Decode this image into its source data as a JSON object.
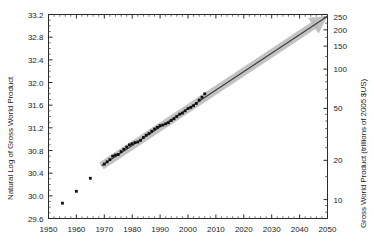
{
  "chart_data": {
    "type": "scatter",
    "title": "",
    "subtitle": "",
    "xlabel": "",
    "ylabel": "Natural Log of Gross World Product",
    "y2label": "Gross World Product (trillions of 2005 $US)",
    "xlim": [
      1950,
      2050
    ],
    "ylim": [
      29.6,
      33.2
    ],
    "grid": false,
    "legend": false,
    "legend_position": "none",
    "xticks": [
      1950,
      1960,
      1970,
      1980,
      1990,
      2000,
      2010,
      2020,
      2030,
      2040,
      2050
    ],
    "xtick_labels": [
      "1950",
      "1960",
      "1970",
      "1980",
      "1990",
      "2000",
      "2010",
      "2020",
      "2030",
      "2040",
      "2050"
    ],
    "yticks": [
      29.6,
      30.0,
      30.4,
      30.8,
      31.2,
      31.6,
      32.0,
      32.4,
      32.8,
      33.2
    ],
    "ytick_labels": [
      "29.6",
      "30.0",
      "30.4",
      "30.8",
      "31.2",
      "31.6",
      "32.0",
      "32.4",
      "32.8",
      "33.2"
    ],
    "y2_scale": "log",
    "y2ticks": [
      10,
      20,
      50,
      100,
      150,
      200,
      250
    ],
    "y2tick_labels": [
      "10",
      "20",
      "50",
      "100",
      "150",
      "200",
      "250"
    ],
    "series": [
      {
        "name": "Gross World Product (ln)",
        "marker": "square",
        "color": "#111111",
        "x": [
          1955,
          1960,
          1965,
          1970,
          1971,
          1972,
          1973,
          1974,
          1975,
          1976,
          1977,
          1978,
          1979,
          1980,
          1981,
          1982,
          1983,
          1984,
          1985,
          1986,
          1987,
          1988,
          1989,
          1990,
          1991,
          1992,
          1993,
          1994,
          1995,
          1996,
          1997,
          1998,
          1999,
          2000,
          2001,
          2002,
          2003,
          2004,
          2005,
          2006
        ],
        "y": [
          29.87,
          30.08,
          30.31,
          30.56,
          30.6,
          30.64,
          30.7,
          30.72,
          30.73,
          30.78,
          30.82,
          30.86,
          30.9,
          30.92,
          30.94,
          30.95,
          30.98,
          31.03,
          31.07,
          31.1,
          31.14,
          31.18,
          31.21,
          31.24,
          31.25,
          31.27,
          31.29,
          31.33,
          31.36,
          31.4,
          31.44,
          31.46,
          31.5,
          31.54,
          31.56,
          31.59,
          31.63,
          31.69,
          31.74,
          31.8
        ]
      }
    ],
    "annotations": [
      {
        "name": "growth-trend-arrow",
        "type": "arrow",
        "x_start": 1969,
        "y_start": 30.53,
        "x_end": 2050,
        "y_end": 33.17,
        "color": "#b9b9b9",
        "line_color": "#3a3a3a"
      }
    ]
  },
  "axes": {
    "left": {
      "title": "Natural Log of Gross World Product"
    },
    "right": {
      "title": "Gross World Product (trillions of 2005 $US)"
    }
  },
  "colors": {
    "marker": "#111111",
    "band": "#b9b9b9",
    "line": "#3a3a3a",
    "frame": "#2a2a2a",
    "text": "#1b1b1b",
    "background": "#ffffff"
  }
}
